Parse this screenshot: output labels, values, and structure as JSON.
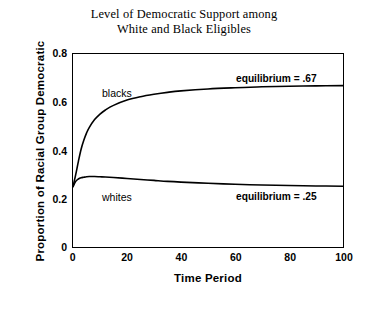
{
  "chart_data": {
    "type": "line",
    "title": "Level of Democratic Support among White and Black Eligibles",
    "title_lines": [
      "Level of Democratic Support among",
      "White and Black Eligibles"
    ],
    "xlabel": "Time Period",
    "ylabel": "Proportion of Racial Group Democratic",
    "xlim": [
      0,
      100
    ],
    "ylim": [
      0,
      0.8
    ],
    "grid": false,
    "legend": "inline-curve-labels",
    "x_ticks": [
      0,
      20,
      40,
      60,
      80,
      100
    ],
    "x_tick_labels": [
      "0",
      "20",
      "40",
      "60",
      "80",
      "100"
    ],
    "x_minor_ticks": [
      10,
      30,
      50,
      70,
      90
    ],
    "y_ticks": [
      0,
      0.2,
      0.4,
      0.6,
      0.8
    ],
    "y_tick_labels": [
      "0",
      "0.2",
      "0.4",
      "0.6",
      "0.8"
    ],
    "y_minor_ticks": [
      0.1,
      0.3,
      0.5,
      0.7
    ],
    "series": [
      {
        "name": "blacks",
        "label": "blacks",
        "color": "#000000",
        "equilibrium": 0.67,
        "equilibrium_label": "equilibrium = .67",
        "x": [
          0,
          1,
          2,
          3,
          4,
          5,
          6,
          8,
          10,
          12,
          15,
          20,
          25,
          30,
          35,
          40,
          50,
          60,
          70,
          80,
          90,
          100
        ],
        "values": [
          0.25,
          0.3,
          0.355,
          0.405,
          0.442,
          0.472,
          0.495,
          0.528,
          0.551,
          0.568,
          0.587,
          0.609,
          0.623,
          0.633,
          0.641,
          0.647,
          0.655,
          0.66,
          0.664,
          0.666,
          0.668,
          0.669
        ]
      },
      {
        "name": "whites",
        "label": "whites",
        "color": "#000000",
        "equilibrium": 0.25,
        "equilibrium_label": "equilibrium = .25",
        "x": [
          0,
          1,
          2,
          3,
          4,
          5,
          6,
          8,
          10,
          12,
          15,
          20,
          25,
          30,
          35,
          40,
          50,
          60,
          70,
          80,
          90,
          100
        ],
        "values": [
          0.25,
          0.272,
          0.282,
          0.287,
          0.289,
          0.291,
          0.292,
          0.292,
          0.291,
          0.29,
          0.288,
          0.284,
          0.28,
          0.276,
          0.272,
          0.269,
          0.264,
          0.26,
          0.257,
          0.255,
          0.253,
          0.252
        ]
      }
    ],
    "annotations": [
      {
        "name": "equilibrium-black",
        "text": "equilibrium = .67",
        "x": 72,
        "y": 0.695
      },
      {
        "name": "equilibrium-white",
        "text": "equilibrium = .25",
        "x": 72,
        "y": 0.225
      },
      {
        "name": "series-label-blacks",
        "text": "blacks",
        "x": 12,
        "y": 0.645
      },
      {
        "name": "series-label-whites",
        "text": "whites",
        "x": 12,
        "y": 0.215
      }
    ]
  }
}
